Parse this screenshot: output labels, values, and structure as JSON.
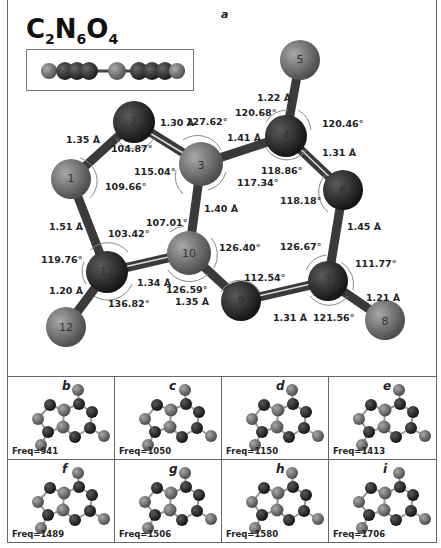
{
  "figure": {
    "formula": {
      "C": "C",
      "c_count": "2",
      "N": "N",
      "n_count": "6",
      "O": "O",
      "o_count": "4"
    },
    "main_panel_letter": "a",
    "atoms": [
      "1",
      "2",
      "3",
      "4",
      "5",
      "6",
      "7",
      "8",
      "9",
      "10",
      "11",
      "12"
    ],
    "bond_lengths": {
      "b1_2": "1.35 Å",
      "b2_3": "1.30 Å",
      "b3_4": "1.41 Å",
      "b4_5": "1.22 Å",
      "b4_6": "1.31 Å",
      "b3_10": "1.40 Å",
      "b6_7": "1.45 Å",
      "b1_11": "1.51 Å",
      "b10_11": "1.34 Å",
      "b11_12": "1.20 Å",
      "b10_9": "1.35 Å",
      "b9_7": "1.31 Å",
      "b7_8": "1.21 Å"
    },
    "angles": {
      "a2_inner": "104.87°",
      "a3_top": "127.62°",
      "a3_inner": "115.04°",
      "a3_right": "117.34°",
      "a1": "109.66°",
      "a4_left": "120.68°",
      "a4_right": "120.46°",
      "a4_bottom": "118.86°",
      "a6": "118.18°",
      "a11_top": "103.42°",
      "a11_left": "119.76°",
      "a11_bottom": "136.82°",
      "a10_top": "107.01°",
      "a10_right": "126.40°",
      "a10_bottom": "126.59°",
      "a9": "112.54°",
      "a7_top": "126.67°",
      "a7_right": "111.77°",
      "a7_bottom": "121.56°"
    },
    "modes": [
      {
        "letter": "b",
        "freq": "Freq=941"
      },
      {
        "letter": "c",
        "freq": "Freq=1050"
      },
      {
        "letter": "d",
        "freq": "Freq=1150"
      },
      {
        "letter": "e",
        "freq": "Freq=1413"
      },
      {
        "letter": "f",
        "freq": "Freq=1489"
      },
      {
        "letter": "g",
        "freq": "Freq=1506"
      },
      {
        "letter": "h",
        "freq": "Freq=1580"
      },
      {
        "letter": "i",
        "freq": "Freq=1706"
      }
    ],
    "colors": {
      "nitrogen_dark": "#2b2b2b",
      "carbon_grey": "#7a7a7a",
      "oxygen_grey": "#6e6e6e",
      "border": "#666666"
    }
  }
}
